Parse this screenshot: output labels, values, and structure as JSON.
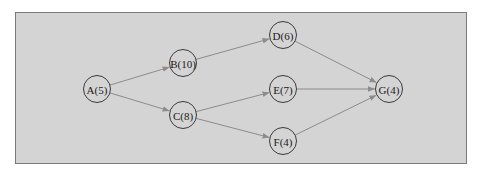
{
  "diagram": {
    "type": "directed-graph",
    "background_color": "#d4d4d4",
    "edge_color": "#8c8c8c",
    "node_stroke_color": "#3a3a3a",
    "nodes": [
      {
        "id": "A",
        "label": "A(5)",
        "duration": 5,
        "x": 97,
        "y": 89
      },
      {
        "id": "B",
        "label": "B(10)",
        "duration": 10,
        "x": 183,
        "y": 63
      },
      {
        "id": "C",
        "label": "C(8)",
        "duration": 8,
        "x": 183,
        "y": 115
      },
      {
        "id": "D",
        "label": "D(6)",
        "duration": 6,
        "x": 283,
        "y": 35
      },
      {
        "id": "E",
        "label": "E(7)",
        "duration": 7,
        "x": 283,
        "y": 89
      },
      {
        "id": "F",
        "label": "F(4)",
        "duration": 4,
        "x": 283,
        "y": 141
      },
      {
        "id": "G",
        "label": "G(4)",
        "duration": 4,
        "x": 389,
        "y": 89
      }
    ],
    "edges": [
      {
        "from": "A",
        "to": "B"
      },
      {
        "from": "A",
        "to": "C"
      },
      {
        "from": "B",
        "to": "D"
      },
      {
        "from": "C",
        "to": "E"
      },
      {
        "from": "C",
        "to": "F"
      },
      {
        "from": "D",
        "to": "G"
      },
      {
        "from": "E",
        "to": "G"
      },
      {
        "from": "F",
        "to": "G"
      }
    ]
  }
}
